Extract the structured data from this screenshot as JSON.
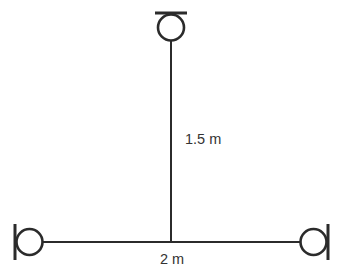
{
  "figure": {
    "type": "physics-diagram",
    "labels": {
      "vertical_distance": "1.5 m",
      "horizontal_distance": "2 m"
    },
    "colors": {
      "background": "#ffffff",
      "line": "#2b2b2b",
      "text": "#333333"
    }
  }
}
